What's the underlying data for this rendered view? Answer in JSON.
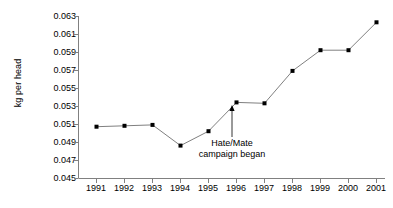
{
  "chart_data": {
    "type": "line",
    "title": "",
    "xlabel": "",
    "ylabel": "kg per head",
    "categories": [
      "1991",
      "1992",
      "1993",
      "1994",
      "1995",
      "1996",
      "1997",
      "1998",
      "1999",
      "2000",
      "2001"
    ],
    "values": [
      0.0507,
      0.0508,
      0.0509,
      0.0486,
      0.0502,
      0.0534,
      0.0533,
      0.0569,
      0.0592,
      0.0592,
      0.0623
    ],
    "series": [
      {
        "name": "kg per head",
        "values": [
          0.0507,
          0.0508,
          0.0509,
          0.0486,
          0.0502,
          0.0534,
          0.0533,
          0.0569,
          0.0592,
          0.0592,
          0.0623
        ]
      }
    ],
    "ylim": [
      0.045,
      0.063
    ],
    "yticks": [
      "0.045",
      "0.047",
      "0.049",
      "0.051",
      "0.053",
      "0.055",
      "0.057",
      "0.059",
      "0.061",
      "0.063"
    ],
    "ytick_values": [
      0.045,
      0.047,
      0.049,
      0.051,
      0.053,
      0.055,
      0.057,
      0.059,
      0.061,
      0.063
    ],
    "grid": false,
    "legend": "none",
    "line_color": "#808080",
    "marker_color": "#000000",
    "axis_color": "#808080",
    "annotations": [
      {
        "line1": "Hate/Mate",
        "line2": "campaign began",
        "target_category": "1996",
        "target_value": 0.0534,
        "arrow": "up-arrow"
      }
    ]
  },
  "axis": {
    "y_title": "kg per head"
  }
}
